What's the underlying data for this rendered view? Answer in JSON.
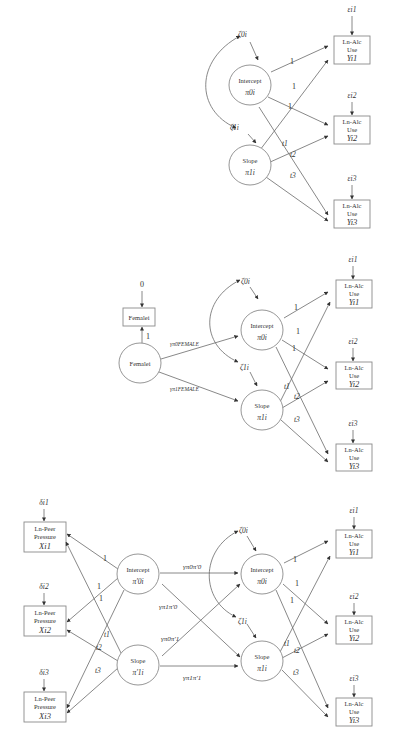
{
  "figure": {
    "panel_a": {
      "intercept": {
        "label": "Intercept",
        "symbol": "π0i"
      },
      "slope": {
        "label": "Slope",
        "symbol": "π1i"
      },
      "zeta0": "ζ0i",
      "zeta1": "ζ1i",
      "outcomes": [
        {
          "l1": "Ln-Alc",
          "l2": "Use",
          "var": "Yi1",
          "err": "εi1"
        },
        {
          "l1": "Ln-Alc",
          "l2": "Use",
          "var": "Yi2",
          "err": "εi2"
        },
        {
          "l1": "Ln-Alc",
          "l2": "Use",
          "var": "Yi3",
          "err": "εi3"
        }
      ],
      "loadings_intercept": [
        "1",
        "1",
        "1"
      ],
      "loadings_slope": [
        "t1",
        "t2",
        "t3"
      ]
    },
    "panel_b": {
      "covariate_obs": {
        "label": "Femalei",
        "fixed": "0",
        "loading": "1"
      },
      "covariate_latent": {
        "label": "Femalei"
      },
      "gamma_intercept": "γπ0FEMALE",
      "gamma_slope": "γπ1FEMALE",
      "intercept": {
        "label": "Intercept",
        "symbol": "π0i"
      },
      "slope": {
        "label": "Slope",
        "symbol": "π1i"
      },
      "zeta0": "ζ0i",
      "zeta1": "ζ1i",
      "outcomes": [
        {
          "l1": "Ln-Alc",
          "l2": "Use",
          "var": "Yi1",
          "err": "εi1"
        },
        {
          "l1": "Ln-Alc",
          "l2": "Use",
          "var": "Yi2",
          "err": "εi2"
        },
        {
          "l1": "Ln-Alc",
          "l2": "Use",
          "var": "Yi3",
          "err": "εi3"
        }
      ],
      "loadings_intercept": [
        "1",
        "1",
        "1"
      ],
      "loadings_slope": [
        "t1",
        "t2",
        "t3"
      ]
    },
    "panel_c": {
      "predictors": [
        {
          "l1": "Ln-Peer",
          "l2": "Pressure",
          "var": "Xi1",
          "err": "δi1"
        },
        {
          "l1": "Ln-Peer",
          "l2": "Pressure",
          "var": "Xi2",
          "err": "δi2"
        },
        {
          "l1": "Ln-Peer",
          "l2": "Pressure",
          "var": "Xi3",
          "err": "δi3"
        }
      ],
      "pred_intercept": {
        "label": "Intercept",
        "symbol": "π′0i"
      },
      "pred_slope": {
        "label": "Slope",
        "symbol": "π′1i"
      },
      "pred_loadings_intercept": [
        "1",
        "1",
        "1"
      ],
      "pred_loadings_slope": [
        "t1",
        "t2",
        "t3"
      ],
      "gammas": {
        "g00": "γπ0π′0",
        "g10": "γπ1π′0",
        "g01": "γπ0π′1",
        "g11": "γπ1π′1"
      },
      "intercept": {
        "label": "Intercept",
        "symbol": "π0i"
      },
      "slope": {
        "label": "Slope",
        "symbol": "π1i"
      },
      "zeta0": "ζ0i",
      "zeta1": "ζ1i",
      "outcomes": [
        {
          "l1": "Ln-Alc",
          "l2": "Use",
          "var": "Yi1",
          "err": "εi1"
        },
        {
          "l1": "Ln-Alc",
          "l2": "Use",
          "var": "Yi2",
          "err": "εi2"
        },
        {
          "l1": "Ln-Alc",
          "l2": "Use",
          "var": "Yi3",
          "err": "εi3"
        }
      ],
      "loadings_intercept": [
        "1",
        "1",
        "1"
      ],
      "loadings_slope": [
        "t1",
        "t2",
        "t3"
      ]
    }
  }
}
